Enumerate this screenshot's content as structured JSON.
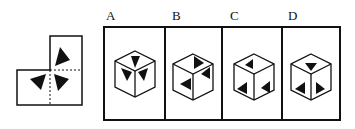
{
  "puzzle": {
    "type": "cube-net-folding",
    "net": {
      "description": "L-shaped net of three square faces; top-right square has one triangle, bottom-left square has one triangle, bottom-right square has one triangle; three triangles meet near the shared corner, dashed fold lines"
    },
    "options": [
      {
        "label": "A"
      },
      {
        "label": "B"
      },
      {
        "label": "C"
      },
      {
        "label": "D"
      }
    ],
    "colors": {
      "stroke": "#111111",
      "fill": "#111111",
      "background": "#ffffff"
    }
  }
}
